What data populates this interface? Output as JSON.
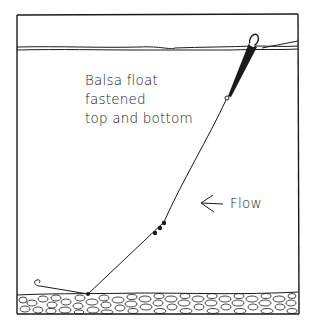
{
  "diagram": {
    "caption_lines": [
      "Balsa float",
      "fastened",
      "top and bottom"
    ],
    "flow_label": "Flow",
    "elements": {
      "water_surface": "double wavy line near top",
      "float": "balsa float, dark body, ring at each end",
      "line": "fishing line from float to bottom",
      "shot": 3,
      "hook": "hook lying on bottom",
      "bottom": "gravel bed"
    },
    "colors": {
      "ink": "#1a1a1a",
      "background": "#ffffff"
    }
  }
}
